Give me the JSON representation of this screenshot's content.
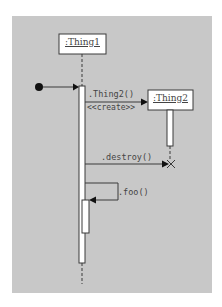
{
  "diagram": {
    "type": "uml-sequence",
    "colors": {
      "panel_background": "#c8c8c8",
      "page_background": "#ffffff",
      "line": "#3a3a3a",
      "box_fill": "#ffffff",
      "text": "#444444"
    },
    "lifelines": [
      {
        "id": "thing1",
        "label": ":Thing1"
      },
      {
        "id": "thing2",
        "label": ":Thing2"
      }
    ],
    "messages": [
      {
        "id": "found",
        "label": "",
        "from": "found-message",
        "to": "thing1"
      },
      {
        "id": "create",
        "label": ".Thing2()",
        "stereotype": "<<create>>",
        "from": "thing1",
        "to": "thing2"
      },
      {
        "id": "destroy",
        "label": ".destroy()",
        "from": "thing1",
        "to": "thing2"
      },
      {
        "id": "self",
        "label": ".foo()",
        "from": "thing1",
        "to": "thing1"
      }
    ]
  }
}
